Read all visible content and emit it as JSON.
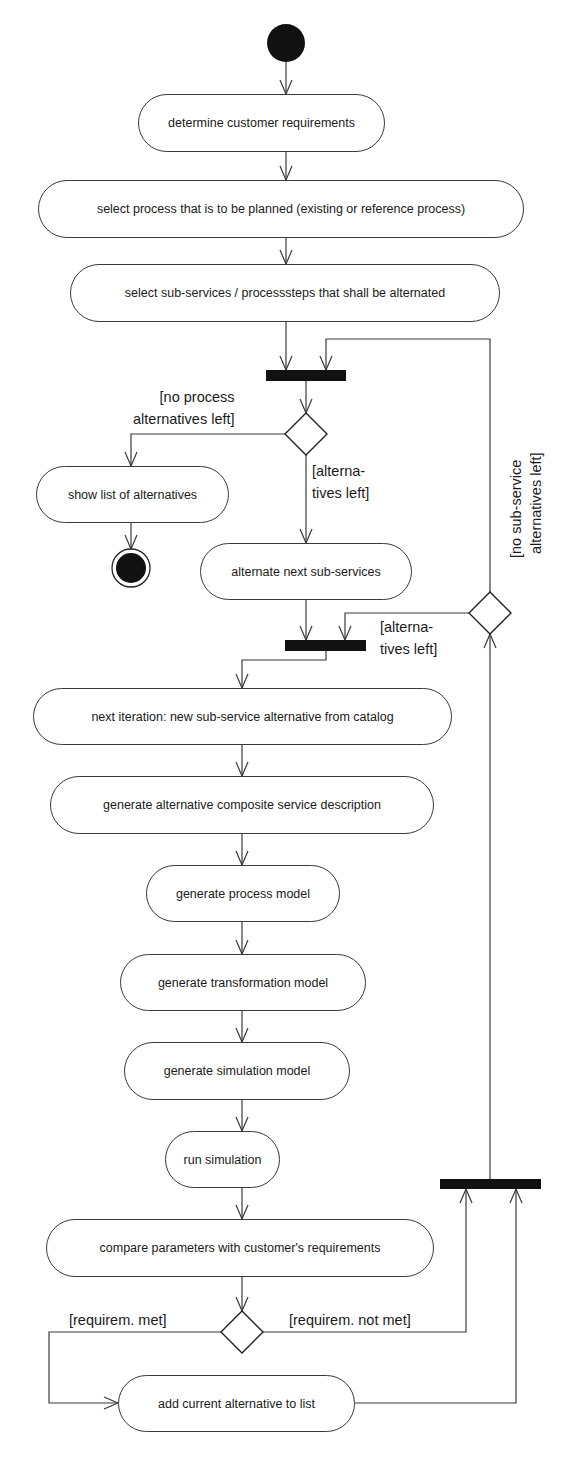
{
  "diagram": {
    "type": "UML activity diagram",
    "start_node": "initial-node",
    "end_node": "final-node",
    "actions": {
      "a1": "determine customer requirements",
      "a2": "select process that is to be planned (existing or reference process)",
      "a3": "select sub-services / processsteps that shall be alternated",
      "a4": "show list of alternatives",
      "a5": "alternate next sub-services",
      "a6": "next iteration: new sub-service alternative from catalog",
      "a7": "generate alternative composite service description",
      "a8": "generate process model",
      "a9": "generate transformation model",
      "a10": "generate simulation model",
      "a11": "run simulation",
      "a12": "compare parameters with customer's requirements",
      "a13": "add current alternative to list"
    },
    "guards": {
      "no_process_line1": "[no process",
      "no_process_line2": "alternatives left]",
      "alt_left_line1": "[alterna-",
      "alt_left_line2": "tives left]",
      "alt_left2_line1": "[alterna-",
      "alt_left2_line2": "tives left]",
      "no_sub_line1": "[no sub-service",
      "no_sub_line2": "alternatives left]",
      "req_met": "[requirem. met]",
      "req_not_met": "[requirem. not met]"
    },
    "edges": [
      [
        "initial-node",
        "a1"
      ],
      [
        "a1",
        "a2"
      ],
      [
        "a2",
        "a3"
      ],
      [
        "a3",
        "join-bar-1"
      ],
      [
        "join-bar-1",
        "decision-1"
      ],
      [
        "decision-1",
        "a4",
        "[no process alternatives left]"
      ],
      [
        "decision-1",
        "a5",
        "[alternatives left]"
      ],
      [
        "a4",
        "final-node"
      ],
      [
        "a5",
        "join-bar-2"
      ],
      [
        "join-bar-2",
        "a6"
      ],
      [
        "a6",
        "a7"
      ],
      [
        "a7",
        "a8"
      ],
      [
        "a8",
        "a9"
      ],
      [
        "a9",
        "a10"
      ],
      [
        "a10",
        "a11"
      ],
      [
        "a11",
        "a12"
      ],
      [
        "a12",
        "decision-3"
      ],
      [
        "decision-3",
        "a13",
        "[requirem. met]"
      ],
      [
        "decision-3",
        "join-bar-3",
        "[requirem. not met]"
      ],
      [
        "a13",
        "join-bar-3"
      ],
      [
        "join-bar-3",
        "decision-2"
      ],
      [
        "decision-2",
        "join-bar-2",
        "[alternatives left]"
      ],
      [
        "decision-2",
        "join-bar-1",
        "[no sub-service alternatives left]"
      ]
    ]
  }
}
